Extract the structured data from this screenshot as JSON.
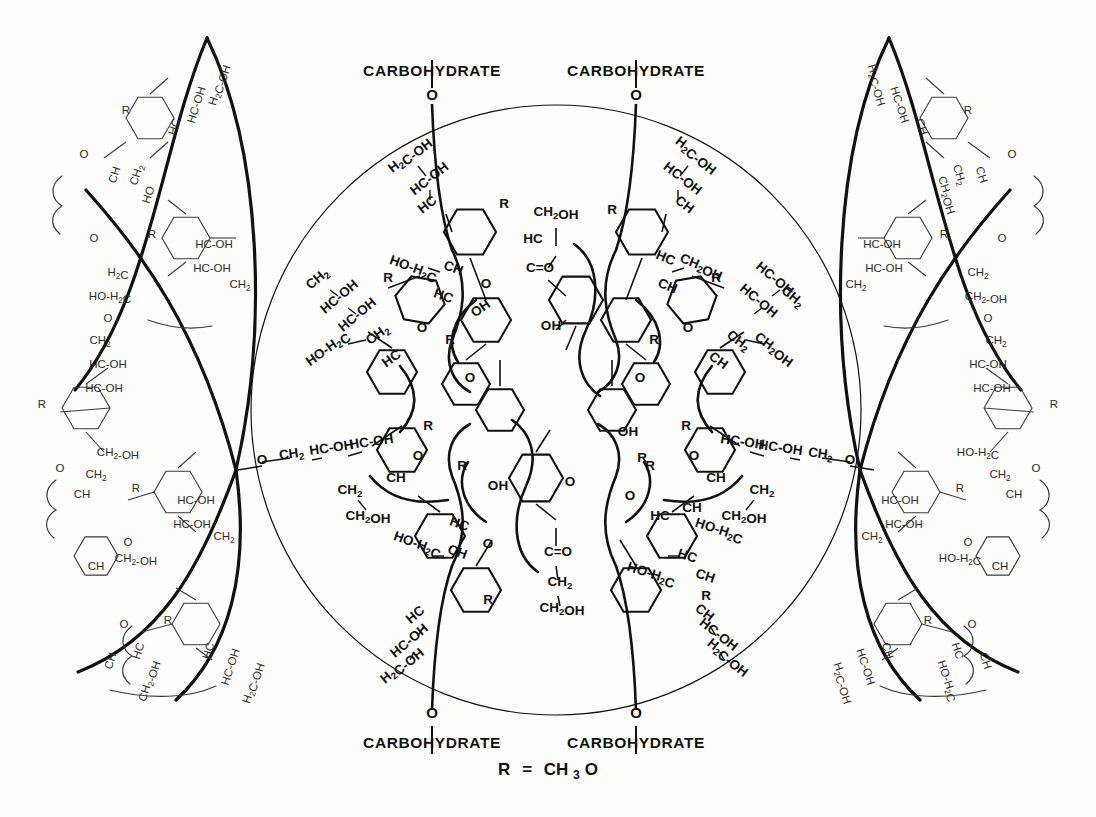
{
  "figure": {
    "domain": "Diagram",
    "kind": "chemical-structure-diagram",
    "title_visible": false,
    "background_color": "#fdfdfb",
    "line_color": "#111111",
    "canvas": {
      "width": 1096,
      "height": 817
    }
  },
  "legend": {
    "text": "R = CH3O",
    "r_symbol": "R",
    "equals": "=",
    "group": "CH",
    "group_sub": "3",
    "group_tail": "O",
    "x": 548,
    "y": 768
  },
  "carbohydrate_labels": [
    {
      "id": "carb-top-left",
      "text": "CARBOHYDRATE",
      "x": 432,
      "y": 72,
      "link_atom": "O",
      "link_x": 432,
      "link_y": 104
    },
    {
      "id": "carb-top-right",
      "text": "CARBOHYDRATE",
      "x": 636,
      "y": 72,
      "link_atom": "O",
      "link_x": 636,
      "link_y": 104
    },
    {
      "id": "carb-bottom-left",
      "text": "CARBOHYDRATE",
      "x": 432,
      "y": 742,
      "link_atom": "O",
      "link_x": 432,
      "link_y": 710
    },
    {
      "id": "carb-bottom-right",
      "text": "CARBOHYDRATE",
      "x": 636,
      "y": 742,
      "link_atom": "O",
      "link_x": 636,
      "link_y": 710
    }
  ],
  "central_circle": {
    "cx": 556,
    "cy": 410,
    "r": 305,
    "stroke_width": 1.2
  },
  "lens_arcs": {
    "count": 4,
    "description": "two lens/eye shaped heavy arc pairs, left and right of the central circle",
    "stroke_width": 3.2
  },
  "core_units": [
    {
      "id": "core-top",
      "atoms": [
        "CH2OH",
        "HC",
        "C=O",
        "OH"
      ],
      "x": 556,
      "y": 250
    },
    {
      "id": "core-bottom",
      "atoms": [
        "OH",
        "C=O",
        "CH2",
        "CH2OH"
      ],
      "x": 556,
      "y": 560
    }
  ],
  "side_chain_motifs": [
    {
      "id": "motif-h2c-oh",
      "text": "H2C-OH"
    },
    {
      "id": "motif-hc-oh",
      "text": "HC-OH"
    },
    {
      "id": "motif-hc",
      "text": "HC"
    },
    {
      "id": "motif-ch",
      "text": "CH"
    },
    {
      "id": "motif-ch2",
      "text": "CH2"
    },
    {
      "id": "motif-ch2oh",
      "text": "CH2OH"
    },
    {
      "id": "motif-ho-h2c",
      "text": "HO-H2C"
    },
    {
      "id": "motif-ch2-oh",
      "text": "CH2-OH"
    },
    {
      "id": "motif-o",
      "text": "O"
    },
    {
      "id": "motif-oh",
      "text": "OH"
    },
    {
      "id": "motif-r",
      "text": "R"
    },
    {
      "id": "motif-c-o",
      "text": "C=O"
    }
  ],
  "inner_labels": [
    {
      "t": "H2C-OH",
      "x": 412,
      "y": 158,
      "rot": -38
    },
    {
      "t": "HC-OH",
      "x": 432,
      "y": 182,
      "rot": -38
    },
    {
      "t": "HC",
      "x": 430,
      "y": 208,
      "rot": -38
    },
    {
      "t": "R",
      "x": 504,
      "y": 208,
      "rot": 0
    },
    {
      "t": "CH2OH",
      "x": 556,
      "y": 216,
      "rot": 0
    },
    {
      "t": "HC",
      "x": 533,
      "y": 243,
      "rot": 0
    },
    {
      "t": "C=O",
      "x": 540,
      "y": 272,
      "rot": 0
    },
    {
      "t": "OH",
      "x": 551,
      "y": 330,
      "rot": 0
    },
    {
      "t": "OH",
      "x": 483,
      "y": 312,
      "rot": -35
    },
    {
      "t": "H2C-OH",
      "x": 694,
      "y": 158,
      "rot": 38
    },
    {
      "t": "HC-OH",
      "x": 680,
      "y": 182,
      "rot": 38
    },
    {
      "t": "CH",
      "x": 682,
      "y": 208,
      "rot": 38
    },
    {
      "t": "R",
      "x": 612,
      "y": 214,
      "rot": 0
    },
    {
      "t": "CH2OH",
      "x": 700,
      "y": 270,
      "rot": 22
    },
    {
      "t": "HC",
      "x": 664,
      "y": 262,
      "rot": 22
    },
    {
      "t": "CH",
      "x": 666,
      "y": 290,
      "rot": 22
    },
    {
      "t": "HO-H2C",
      "x": 412,
      "y": 272,
      "rot": 20
    },
    {
      "t": "CH",
      "x": 452,
      "y": 272,
      "rot": 20
    },
    {
      "t": "HC",
      "x": 442,
      "y": 300,
      "rot": 20
    },
    {
      "t": "O",
      "x": 486,
      "y": 288,
      "rot": 0
    },
    {
      "t": "CH2",
      "x": 320,
      "y": 282,
      "rot": -40
    },
    {
      "t": "HC-OH",
      "x": 342,
      "y": 300,
      "rot": -40
    },
    {
      "t": "HC-OH",
      "x": 360,
      "y": 318,
      "rot": -40
    },
    {
      "t": "R",
      "x": 388,
      "y": 282,
      "rot": 0
    },
    {
      "t": "HO-H2C",
      "x": 330,
      "y": 352,
      "rot": -36
    },
    {
      "t": "CH2",
      "x": 380,
      "y": 338,
      "rot": -36
    },
    {
      "t": "HC",
      "x": 394,
      "y": 362,
      "rot": -36
    },
    {
      "t": "O",
      "x": 422,
      "y": 332,
      "rot": 0
    },
    {
      "t": "R",
      "x": 450,
      "y": 344,
      "rot": 0
    },
    {
      "t": "O",
      "x": 470,
      "y": 382,
      "rot": 0
    },
    {
      "t": "HC-OH",
      "x": 772,
      "y": 282,
      "rot": 40
    },
    {
      "t": "CH2",
      "x": 790,
      "y": 300,
      "rot": 40
    },
    {
      "t": "HC-OH",
      "x": 756,
      "y": 304,
      "rot": 40
    },
    {
      "t": "R",
      "x": 716,
      "y": 282,
      "rot": 0
    },
    {
      "t": "CH2OH",
      "x": 772,
      "y": 352,
      "rot": 36
    },
    {
      "t": "CH2",
      "x": 736,
      "y": 344,
      "rot": 36
    },
    {
      "t": "CH",
      "x": 716,
      "y": 364,
      "rot": 36
    },
    {
      "t": "O",
      "x": 688,
      "y": 332,
      "rot": 0
    },
    {
      "t": "R",
      "x": 654,
      "y": 344,
      "rot": 0
    },
    {
      "t": "O",
      "x": 640,
      "y": 382,
      "rot": 0
    },
    {
      "t": "CH2",
      "x": 292,
      "y": 458,
      "rot": -8
    },
    {
      "t": "O",
      "x": 262,
      "y": 464,
      "rot": 0
    },
    {
      "t": "HC-OH",
      "x": 332,
      "y": 452,
      "rot": -8
    },
    {
      "t": "HC-OH",
      "x": 372,
      "y": 446,
      "rot": -8
    },
    {
      "t": "R",
      "x": 428,
      "y": 430,
      "rot": 0
    },
    {
      "t": "CH2",
      "x": 350,
      "y": 494,
      "rot": 0
    },
    {
      "t": "CH2OH",
      "x": 368,
      "y": 520,
      "rot": 0
    },
    {
      "t": "CH",
      "x": 396,
      "y": 482,
      "rot": 0
    },
    {
      "t": "O",
      "x": 418,
      "y": 460,
      "rot": 0
    },
    {
      "t": "R",
      "x": 462,
      "y": 470,
      "rot": 0
    },
    {
      "t": "CH2",
      "x": 820,
      "y": 458,
      "rot": 8
    },
    {
      "t": "O",
      "x": 850,
      "y": 464,
      "rot": 0
    },
    {
      "t": "HC-OH",
      "x": 780,
      "y": 452,
      "rot": 8
    },
    {
      "t": "HC-OH",
      "x": 742,
      "y": 446,
      "rot": 8
    },
    {
      "t": "R",
      "x": 686,
      "y": 430,
      "rot": 0
    },
    {
      "t": "CH2",
      "x": 762,
      "y": 494,
      "rot": 0
    },
    {
      "t": "CH2OH",
      "x": 744,
      "y": 520,
      "rot": 0
    },
    {
      "t": "CH",
      "x": 716,
      "y": 482,
      "rot": 0
    },
    {
      "t": "O",
      "x": 694,
      "y": 460,
      "rot": 0
    },
    {
      "t": "R",
      "x": 650,
      "y": 470,
      "rot": 0
    },
    {
      "t": "OH",
      "x": 498,
      "y": 490,
      "rot": 0
    },
    {
      "t": "O",
      "x": 570,
      "y": 486,
      "rot": 0
    },
    {
      "t": "C=O",
      "x": 558,
      "y": 556,
      "rot": 0
    },
    {
      "t": "CH2",
      "x": 560,
      "y": 586,
      "rot": 0
    },
    {
      "t": "CH2OH",
      "x": 562,
      "y": 612,
      "rot": 0
    },
    {
      "t": "HC",
      "x": 458,
      "y": 528,
      "rot": 20
    },
    {
      "t": "O",
      "x": 488,
      "y": 548,
      "rot": 0
    },
    {
      "t": "HO-H2C",
      "x": 416,
      "y": 548,
      "rot": 20
    },
    {
      "t": "CH",
      "x": 456,
      "y": 556,
      "rot": 20
    },
    {
      "t": "R",
      "x": 488,
      "y": 604,
      "rot": 0
    },
    {
      "t": "HC",
      "x": 418,
      "y": 618,
      "rot": -40
    },
    {
      "t": "HC-OH",
      "x": 412,
      "y": 644,
      "rot": -40
    },
    {
      "t": "H2C-OH",
      "x": 404,
      "y": 668,
      "rot": -40
    },
    {
      "t": "OH",
      "x": 628,
      "y": 436,
      "rot": 0
    },
    {
      "t": "R",
      "x": 642,
      "y": 462,
      "rot": 0
    },
    {
      "t": "HC",
      "x": 660,
      "y": 520,
      "rot": 0
    },
    {
      "t": "CH",
      "x": 692,
      "y": 512,
      "rot": 0
    },
    {
      "t": "O",
      "x": 630,
      "y": 500,
      "rot": 0
    },
    {
      "t": "HO-H2C",
      "x": 718,
      "y": 534,
      "rot": 18
    },
    {
      "t": "HC",
      "x": 686,
      "y": 560,
      "rot": 18
    },
    {
      "t": "CH",
      "x": 704,
      "y": 580,
      "rot": 18
    },
    {
      "t": "HO-H2C",
      "x": 650,
      "y": 578,
      "rot": 18
    },
    {
      "t": "R",
      "x": 706,
      "y": 600,
      "rot": 0
    },
    {
      "t": "CH",
      "x": 702,
      "y": 616,
      "rot": 38
    },
    {
      "t": "HC-OH",
      "x": 716,
      "y": 638,
      "rot": 38
    },
    {
      "t": "H2C-OH",
      "x": 726,
      "y": 660,
      "rot": 38
    }
  ],
  "outer_labels": [
    {
      "t": "H2C-OH",
      "x": 222,
      "y": 86,
      "rot": -72
    },
    {
      "t": "HC-OH",
      "x": 200,
      "y": 106,
      "rot": -72
    },
    {
      "t": "HC",
      "x": 178,
      "y": 128,
      "rot": -72
    },
    {
      "t": "R",
      "x": 126,
      "y": 114,
      "rot": 0
    },
    {
      "t": "O",
      "x": 84,
      "y": 158,
      "rot": 0
    },
    {
      "t": "CH",
      "x": 118,
      "y": 176,
      "rot": -72
    },
    {
      "t": "CH2",
      "x": 140,
      "y": 176,
      "rot": -72
    },
    {
      "t": "HO",
      "x": 152,
      "y": 196,
      "rot": -72
    },
    {
      "t": "O",
      "x": 94,
      "y": 242,
      "rot": 0
    },
    {
      "t": "R",
      "x": 152,
      "y": 238,
      "rot": 0
    },
    {
      "t": "HC-OH",
      "x": 214,
      "y": 248,
      "rot": 0
    },
    {
      "t": "HC-OH",
      "x": 212,
      "y": 272,
      "rot": 0
    },
    {
      "t": "CH2",
      "x": 240,
      "y": 288,
      "rot": 0
    },
    {
      "t": "H2C",
      "x": 118,
      "y": 276,
      "rot": 0
    },
    {
      "t": "HO-H2C",
      "x": 110,
      "y": 300,
      "rot": 0
    },
    {
      "t": "O",
      "x": 108,
      "y": 322,
      "rot": 0
    },
    {
      "t": "CH2",
      "x": 100,
      "y": 344,
      "rot": 0
    },
    {
      "t": "HC-OH",
      "x": 108,
      "y": 368,
      "rot": 0
    },
    {
      "t": "HC-OH",
      "x": 104,
      "y": 392,
      "rot": 0
    },
    {
      "t": "R",
      "x": 42,
      "y": 408,
      "rot": 0
    },
    {
      "t": "O",
      "x": 60,
      "y": 472,
      "rot": 0
    },
    {
      "t": "CH2-OH",
      "x": 118,
      "y": 456,
      "rot": 0
    },
    {
      "t": "CH2",
      "x": 96,
      "y": 478,
      "rot": 0
    },
    {
      "t": "CH",
      "x": 82,
      "y": 498,
      "rot": 0
    },
    {
      "t": "R",
      "x": 136,
      "y": 492,
      "rot": 0
    },
    {
      "t": "HC-OH",
      "x": 196,
      "y": 504,
      "rot": 0
    },
    {
      "t": "HC-OH",
      "x": 192,
      "y": 528,
      "rot": 0
    },
    {
      "t": "CH2",
      "x": 224,
      "y": 540,
      "rot": 0
    },
    {
      "t": "O",
      "x": 128,
      "y": 546,
      "rot": 0
    },
    {
      "t": "CH2-OH",
      "x": 136,
      "y": 562,
      "rot": 0
    },
    {
      "t": "CH",
      "x": 96,
      "y": 570,
      "rot": 0
    },
    {
      "t": "R",
      "x": 168,
      "y": 624,
      "rot": 0
    },
    {
      "t": "O",
      "x": 124,
      "y": 628,
      "rot": 0
    },
    {
      "t": "CH",
      "x": 114,
      "y": 662,
      "rot": -72
    },
    {
      "t": "HC",
      "x": 142,
      "y": 652,
      "rot": -72
    },
    {
      "t": "CH2-OH",
      "x": 152,
      "y": 682,
      "rot": -72
    },
    {
      "t": "HC",
      "x": 212,
      "y": 652,
      "rot": -72
    },
    {
      "t": "HC-OH",
      "x": 234,
      "y": 668,
      "rot": -72
    },
    {
      "t": "H2C-OH",
      "x": 256,
      "y": 684,
      "rot": -72
    },
    {
      "t": "H2C-OH",
      "x": 874,
      "y": 86,
      "rot": 72
    },
    {
      "t": "HC-OH",
      "x": 896,
      "y": 106,
      "rot": 72
    },
    {
      "t": "CH",
      "x": 918,
      "y": 128,
      "rot": 72
    },
    {
      "t": "R",
      "x": 968,
      "y": 114,
      "rot": 0
    },
    {
      "t": "O",
      "x": 1012,
      "y": 158,
      "rot": 0
    },
    {
      "t": "CH",
      "x": 978,
      "y": 176,
      "rot": 72
    },
    {
      "t": "CH2",
      "x": 956,
      "y": 176,
      "rot": 72
    },
    {
      "t": "CH2OH",
      "x": 944,
      "y": 196,
      "rot": 72
    },
    {
      "t": "O",
      "x": 1002,
      "y": 242,
      "rot": 0
    },
    {
      "t": "R",
      "x": 944,
      "y": 238,
      "rot": 0
    },
    {
      "t": "HC-OH",
      "x": 882,
      "y": 248,
      "rot": 0
    },
    {
      "t": "HC-OH",
      "x": 884,
      "y": 272,
      "rot": 0
    },
    {
      "t": "CH2",
      "x": 856,
      "y": 288,
      "rot": 0
    },
    {
      "t": "CH2",
      "x": 978,
      "y": 276,
      "rot": 0
    },
    {
      "t": "CH2-OH",
      "x": 986,
      "y": 300,
      "rot": 0
    },
    {
      "t": "O",
      "x": 988,
      "y": 322,
      "rot": 0
    },
    {
      "t": "CH2",
      "x": 996,
      "y": 344,
      "rot": 0
    },
    {
      "t": "HC-OH",
      "x": 988,
      "y": 368,
      "rot": 0
    },
    {
      "t": "HC-OH",
      "x": 992,
      "y": 392,
      "rot": 0
    },
    {
      "t": "R",
      "x": 1054,
      "y": 408,
      "rot": 0
    },
    {
      "t": "O",
      "x": 1036,
      "y": 472,
      "rot": 0
    },
    {
      "t": "HO-H2C",
      "x": 978,
      "y": 456,
      "rot": 0
    },
    {
      "t": "CH2",
      "x": 1000,
      "y": 478,
      "rot": 0
    },
    {
      "t": "CH",
      "x": 1014,
      "y": 498,
      "rot": 0
    },
    {
      "t": "R",
      "x": 960,
      "y": 492,
      "rot": 0
    },
    {
      "t": "HC-OH",
      "x": 900,
      "y": 504,
      "rot": 0
    },
    {
      "t": "HC-OH",
      "x": 904,
      "y": 528,
      "rot": 0
    },
    {
      "t": "CH2",
      "x": 872,
      "y": 540,
      "rot": 0
    },
    {
      "t": "O",
      "x": 968,
      "y": 546,
      "rot": 0
    },
    {
      "t": "HO-H2C",
      "x": 960,
      "y": 562,
      "rot": 0
    },
    {
      "t": "CH",
      "x": 1000,
      "y": 570,
      "rot": 0
    },
    {
      "t": "R",
      "x": 928,
      "y": 624,
      "rot": 0
    },
    {
      "t": "O",
      "x": 972,
      "y": 628,
      "rot": 0
    },
    {
      "t": "CH",
      "x": 982,
      "y": 662,
      "rot": 72
    },
    {
      "t": "HC",
      "x": 954,
      "y": 652,
      "rot": 72
    },
    {
      "t": "HO-H2C",
      "x": 944,
      "y": 682,
      "rot": 72
    },
    {
      "t": "CH",
      "x": 884,
      "y": 652,
      "rot": 72
    },
    {
      "t": "HC-OH",
      "x": 862,
      "y": 668,
      "rot": 72
    },
    {
      "t": "H2C-OH",
      "x": 840,
      "y": 684,
      "rot": 72
    }
  ]
}
